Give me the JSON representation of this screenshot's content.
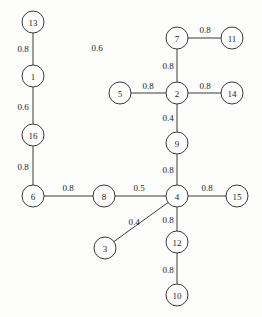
{
  "diagram": {
    "type": "node-link-graph",
    "background_color": "#fdfdfc",
    "node_fill_color": "#ffffff",
    "stroke_color": "#3a3a3a",
    "text_color": "#1c1c1c",
    "node_radius": 11,
    "nodes": [
      {
        "id": "13",
        "label": "13",
        "x": 33,
        "y": 22
      },
      {
        "id": "1",
        "label": "1",
        "x": 33,
        "y": 76
      },
      {
        "id": "16",
        "label": "16",
        "x": 33,
        "y": 135
      },
      {
        "id": "6",
        "label": "6",
        "x": 33,
        "y": 196
      },
      {
        "id": "8",
        "label": "8",
        "x": 104,
        "y": 196
      },
      {
        "id": "3",
        "label": "3",
        "x": 105,
        "y": 248
      },
      {
        "id": "5",
        "label": "5",
        "x": 120,
        "y": 93
      },
      {
        "id": "7",
        "label": "7",
        "x": 177,
        "y": 38
      },
      {
        "id": "11",
        "label": "11",
        "x": 232,
        "y": 38
      },
      {
        "id": "2",
        "label": "2",
        "x": 177,
        "y": 93
      },
      {
        "id": "14",
        "label": "14",
        "x": 232,
        "y": 93
      },
      {
        "id": "9",
        "label": "9",
        "x": 177,
        "y": 143
      },
      {
        "id": "4",
        "label": "4",
        "x": 177,
        "y": 196
      },
      {
        "id": "15",
        "label": "15",
        "x": 237,
        "y": 196
      },
      {
        "id": "12",
        "label": "12",
        "x": 177,
        "y": 242
      },
      {
        "id": "10",
        "label": "10",
        "x": 177,
        "y": 295
      }
    ],
    "edges": [
      {
        "source": "13",
        "target": "1",
        "weight": "0.8",
        "label_x": 23,
        "label_y": 49
      },
      {
        "source": "1",
        "target": "16",
        "weight": "0.6",
        "label_x": 23,
        "label_y": 107
      },
      {
        "source": "16",
        "target": "6",
        "weight": "0.8",
        "label_x": 23,
        "label_y": 167
      },
      {
        "source": "6",
        "target": "8",
        "weight": "0.8",
        "label_x": 68,
        "label_y": 188
      },
      {
        "source": "8",
        "target": "4",
        "weight": "0.5",
        "label_x": 139,
        "label_y": 188
      },
      {
        "source": "3",
        "target": "4",
        "weight": "0.4",
        "label_x": 134,
        "label_y": 222
      },
      {
        "source": "7",
        "target": "11",
        "weight": "0.8",
        "label_x": 205,
        "label_y": 30
      },
      {
        "source": "7",
        "target": "2",
        "weight": "0.8",
        "label_x": 168,
        "label_y": 66
      },
      {
        "source": "5",
        "target": "2",
        "weight": "0.8",
        "label_x": 148,
        "label_y": 86
      },
      {
        "source": "2",
        "target": "14",
        "weight": "0.8",
        "label_x": 205,
        "label_y": 86
      },
      {
        "source": "2",
        "target": "9",
        "weight": "0.4",
        "label_x": 168,
        "label_y": 118
      },
      {
        "source": "9",
        "target": "4",
        "weight": "0.8",
        "label_x": 168,
        "label_y": 170
      },
      {
        "source": "4",
        "target": "15",
        "weight": "0.8",
        "label_x": 207,
        "label_y": 188
      },
      {
        "source": "4",
        "target": "12",
        "weight": "0.8",
        "label_x": 168,
        "label_y": 220
      },
      {
        "source": "12",
        "target": "10",
        "weight": "0.8",
        "label_x": 168,
        "label_y": 270
      }
    ],
    "floating_labels": [
      {
        "text": "0.6",
        "x": 97,
        "y": 48
      }
    ]
  }
}
